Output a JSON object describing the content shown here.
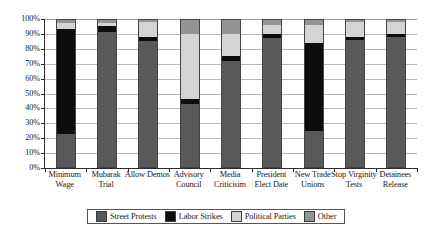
{
  "chart_data": {
    "type": "bar",
    "stacked": true,
    "normalized_percent": true,
    "title": "",
    "xlabel": "",
    "ylabel": "",
    "ylim": [
      0,
      100
    ],
    "ytick_labels": [
      "0%",
      "10%",
      "20%",
      "30%",
      "40%",
      "50%",
      "60%",
      "70%",
      "80%",
      "90%",
      "100%"
    ],
    "ytick_values": [
      0,
      10,
      20,
      30,
      40,
      50,
      60,
      70,
      80,
      90,
      100
    ],
    "grid": true,
    "legend_position": "bottom",
    "categories": [
      "Minimum Wage",
      "Mubarak Trial",
      "Allow Demos",
      "Advisory Council",
      "Media Criticisim",
      "President Elect Date",
      "New Trade Unions",
      "Stop Virginity Tests",
      "Detainees Release"
    ],
    "series": [
      {
        "name": "Street Protests",
        "color": "#595959",
        "values": [
          23,
          91,
          85,
          43,
          72,
          87,
          25,
          86,
          88
        ]
      },
      {
        "name": "Labor Strikes",
        "color": "#0d0d0d",
        "values": [
          70,
          4,
          3,
          3,
          3,
          3,
          59,
          2,
          2
        ]
      },
      {
        "name": "Political Parties",
        "color": "#d4d4d4",
        "values": [
          4,
          2,
          10,
          44,
          15,
          6,
          12,
          10,
          8
        ]
      },
      {
        "name": "Other",
        "color": "#949494",
        "values": [
          3,
          3,
          2,
          10,
          10,
          4,
          4,
          2,
          2
        ]
      }
    ]
  },
  "legend": {
    "items": [
      {
        "label": "Street Protests",
        "color": "#595959"
      },
      {
        "label": "Labor Strikes",
        "color": "#0d0d0d"
      },
      {
        "label": "Political Parties",
        "color": "#d4d4d4"
      },
      {
        "label": "Other",
        "color": "#949494"
      }
    ]
  },
  "xlabels": [
    "Minimum Wage",
    "Mubarak Trial",
    "Allow Demos",
    "Advisory Council",
    "Media Criticisim",
    "President Elect Date",
    "New Trade Unions",
    "Stop Virginity Tests",
    "Detainees Release"
  ]
}
